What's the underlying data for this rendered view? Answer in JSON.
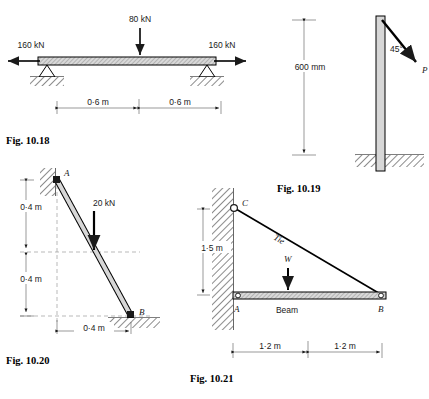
{
  "figures": [
    {
      "id": "fig-10-18",
      "caption": "Fig. 10.18",
      "description": "Simply supported beam with central point load and axial end loads",
      "labels": {
        "center_load": "80 kN",
        "left_load": "160 kN",
        "right_load": "160 kN",
        "dim_left": "0·6 m",
        "dim_right": "0·6 m"
      }
    },
    {
      "id": "fig-10-19",
      "caption": "Fig. 10.19",
      "description": "Vertical pole fixed in ground loaded by inclined force P",
      "labels": {
        "height": "600 mm",
        "angle": "45°",
        "force": "P"
      }
    },
    {
      "id": "fig-10-20",
      "caption": "Fig. 10.20",
      "description": "Inclined strut hinged to wall at A, resting on ground at B, loaded 20 kN",
      "labels": {
        "node_a": "A",
        "node_b": "B",
        "load": "20 kN",
        "dim_upper": "0·4 m",
        "dim_lower": "0·4 m",
        "dim_horizontal": "0·4 m"
      }
    },
    {
      "id": "fig-10-21",
      "caption": "Fig. 10.21",
      "description": "Wall bracket: horizontal beam AB supported by tie from C, carrying load W",
      "labels": {
        "node_a": "A",
        "node_b": "B",
        "node_c": "C",
        "tie": "Tie",
        "beam": "Beam",
        "load": "W",
        "dim_vertical": "1·5 m",
        "dim_left": "1·2 m",
        "dim_right": "1·2 m"
      }
    }
  ],
  "colors": {
    "ink": "#1a1a1a",
    "member_gray": "#d7d7d7",
    "paper": "#ffffff"
  }
}
